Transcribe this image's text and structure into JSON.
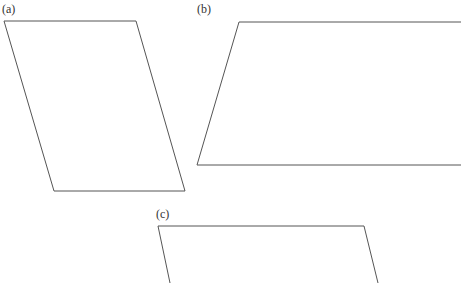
{
  "figures": [
    {
      "label": "(a)",
      "label_pos": [
        2,
        3
      ],
      "shape": "parallelogram",
      "points": [
        [
          4,
          21
        ],
        [
          136,
          21
        ],
        [
          185,
          191
        ],
        [
          54,
          191
        ]
      ]
    },
    {
      "label": "(b)",
      "label_pos": [
        197,
        3
      ],
      "shape": "parallelogram",
      "points": [
        [
          239,
          22
        ],
        [
          461,
          22
        ],
        [
          461,
          165
        ],
        [
          197,
          165
        ]
      ]
    },
    {
      "label": "(c)",
      "label_pos": [
        156,
        208
      ],
      "shape": "parallelogram",
      "points": [
        [
          158,
          226
        ],
        [
          364,
          226
        ],
        [
          378,
          283
        ],
        [
          170,
          283
        ]
      ]
    }
  ],
  "stroke_color": "#555555"
}
